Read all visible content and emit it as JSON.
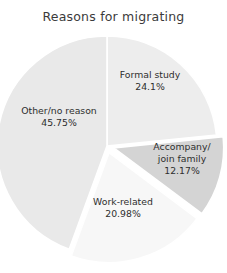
{
  "chart_data": {
    "type": "pie",
    "title": "Reasons for migrating",
    "xlabel": "",
    "ylabel": "",
    "legend_position": "none",
    "grid": false,
    "labels_inline": true,
    "start_angle_deg": 0,
    "direction": "clockwise",
    "categories": [
      "Formal study",
      "Accompany/ join family",
      "Work-related",
      "Other/no reason"
    ],
    "values": [
      24.1,
      12.17,
      20.98,
      45.75
    ],
    "unit": "%",
    "slices": [
      {
        "name": "Formal study",
        "name_line1": "Formal study",
        "name_line2": "",
        "value": 24.1,
        "value_label": "24.1%",
        "color": "#ededed",
        "exploded": false
      },
      {
        "name": "Accompany/ join family",
        "name_line1": "Accompany/",
        "name_line2": "join family",
        "value": 12.17,
        "value_label": "12.17%",
        "color": "#d4d4d4",
        "exploded": true
      },
      {
        "name": "Work-related",
        "name_line1": "Work-related",
        "name_line2": "",
        "value": 20.98,
        "value_label": "20.98%",
        "color": "#f7f7f7",
        "exploded": true
      },
      {
        "name": "Other/no reason",
        "name_line1": "Other/no reason",
        "name_line2": "",
        "value": 45.75,
        "value_label": "45.75%",
        "color": "#e9e9e9",
        "exploded": false
      }
    ],
    "background_color": "#ffffff",
    "edge_color": "#ffffff",
    "text_color": "#2e2e2e",
    "title_color": "#3b3b3b"
  }
}
